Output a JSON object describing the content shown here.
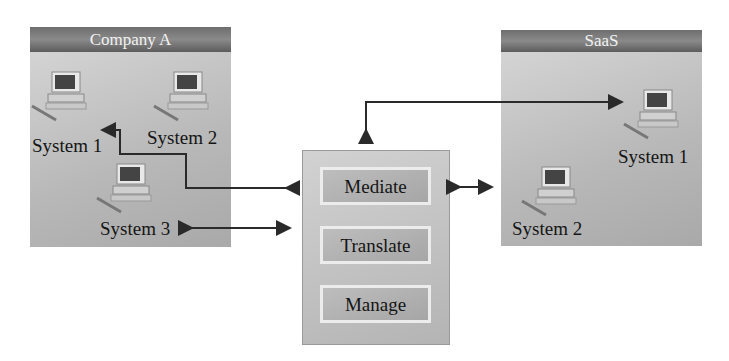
{
  "company": {
    "title": "Company A",
    "systems": [
      "System 1",
      "System 2",
      "System 3"
    ]
  },
  "saas": {
    "title": "SaaS",
    "systems": [
      "System 1",
      "System 2"
    ]
  },
  "hub": {
    "functions": [
      "Mediate",
      "Translate",
      "Manage"
    ]
  },
  "colors": {
    "header": "#6e6e6e",
    "panel": "#b8b8b8",
    "arrow": "#2a2a2a"
  }
}
